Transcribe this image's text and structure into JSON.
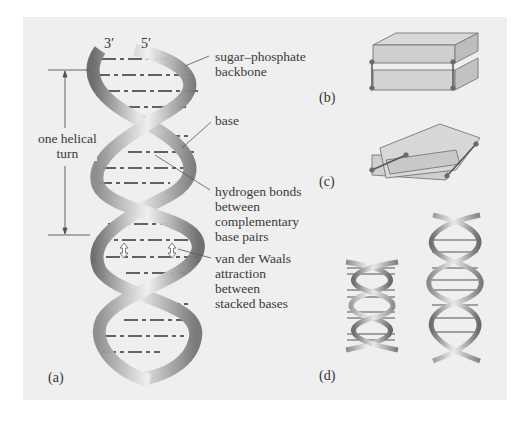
{
  "figure": {
    "panels": [
      {
        "id": "a",
        "label": "(a)"
      },
      {
        "id": "b",
        "label": "(b)"
      },
      {
        "id": "c",
        "label": "(c)"
      },
      {
        "id": "d",
        "label": "(d)"
      }
    ],
    "strand_ends": {
      "left": "3′",
      "right": "5′"
    },
    "dimension_label": "one helical\nturn",
    "annotations": [
      {
        "id": "backbone",
        "text": "sugar–phosphate\nbackbone"
      },
      {
        "id": "base",
        "text": "base"
      },
      {
        "id": "hbonds",
        "text": "hydrogen bonds\nbetween\ncomplementary\nbase pairs"
      },
      {
        "id": "vdw",
        "text": "van der Waals\nattraction\nbetween\nstacked bases"
      }
    ],
    "colors": {
      "background": "#efefef",
      "ribbon_dark": "#6e6e6e",
      "ribbon_light": "#e6e6e6",
      "text": "#3a3a3a"
    }
  }
}
